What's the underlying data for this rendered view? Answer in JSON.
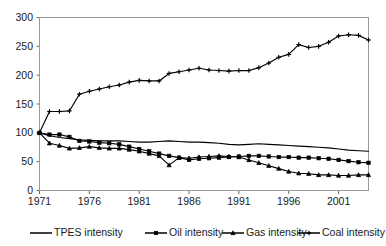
{
  "chart_data": {
    "type": "line",
    "title": "",
    "subtitle": "",
    "xlabel": "",
    "ylabel": "",
    "xlim": [
      1971,
      2004
    ],
    "ylim": [
      0,
      300
    ],
    "grid": false,
    "legend_position": "bottom",
    "x": [
      1971,
      1972,
      1973,
      1974,
      1975,
      1976,
      1977,
      1978,
      1979,
      1980,
      1981,
      1982,
      1983,
      1984,
      1985,
      1986,
      1987,
      1988,
      1989,
      1990,
      1991,
      1992,
      1993,
      1994,
      1995,
      1996,
      1997,
      1998,
      1999,
      2000,
      2001,
      2002,
      2003,
      2004
    ],
    "x_tick_labels": [
      "1971",
      "1976",
      "1981",
      "1986",
      "1991",
      "1996",
      "2001"
    ],
    "x_ticks": [
      1971,
      1976,
      1981,
      1986,
      1991,
      1996,
      2001
    ],
    "y_ticks": [
      0,
      50,
      100,
      150,
      200,
      250,
      300
    ],
    "y_tick_labels": [
      "0",
      "50",
      "100",
      "150",
      "200",
      "250",
      "300"
    ],
    "series": [
      {
        "name": "TPES intensity",
        "marker": "none",
        "values": [
          100,
          95,
          92,
          90,
          88,
          87,
          86,
          86,
          86,
          85,
          84,
          84,
          85,
          86,
          85,
          84,
          84,
          83,
          82,
          80,
          79,
          80,
          81,
          80,
          79,
          78,
          77,
          76,
          75,
          74,
          72,
          70,
          69,
          68
        ]
      },
      {
        "name": "Oil intensity",
        "marker": "square",
        "values": [
          100,
          97,
          97,
          93,
          86,
          85,
          83,
          82,
          80,
          76,
          72,
          68,
          64,
          60,
          57,
          53,
          55,
          56,
          57,
          58,
          59,
          60,
          60,
          59,
          58,
          58,
          57,
          57,
          56,
          55,
          53,
          51,
          49,
          48
        ]
      },
      {
        "name": "Gas intensity",
        "marker": "triangle",
        "values": [
          100,
          82,
          78,
          73,
          74,
          76,
          74,
          73,
          73,
          71,
          68,
          64,
          60,
          44,
          57,
          56,
          58,
          59,
          60,
          59,
          58,
          53,
          48,
          43,
          38,
          33,
          30,
          29,
          27,
          27,
          26,
          26,
          27,
          27
        ]
      },
      {
        "name": "Coal intensity",
        "marker": "cross",
        "values": [
          100,
          137,
          137,
          138,
          167,
          172,
          176,
          180,
          183,
          188,
          191,
          190,
          190,
          203,
          206,
          209,
          212,
          209,
          208,
          207,
          208,
          208,
          213,
          221,
          231,
          236,
          253,
          248,
          250,
          257,
          268,
          270,
          269,
          261
        ]
      }
    ]
  },
  "legend": {
    "items": [
      {
        "label": "TPES intensity",
        "marker": "none"
      },
      {
        "label": "Oil intensity",
        "marker": "square"
      },
      {
        "label": "Gas intensity",
        "marker": "triangle"
      },
      {
        "label": "Coal intensity",
        "marker": "cross"
      }
    ]
  }
}
